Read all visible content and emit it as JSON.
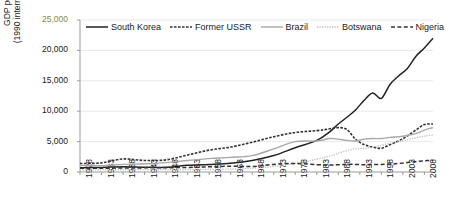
{
  "chart_data": {
    "type": "line",
    "title": "",
    "xlabel": "",
    "ylabel": "GDP per capita\n(1990 international GK$)",
    "ylabel_line1": "GDP per capita",
    "ylabel_line2": "(1990 international GK$)",
    "ylim": [
      0,
      25000
    ],
    "yticks": [
      0,
      5000,
      10000,
      15000,
      20000,
      25000
    ],
    "ytick_labels": [
      "0",
      "5,000",
      "10,000",
      "15,000",
      "20,000",
      "25,000"
    ],
    "xlim": [
      1928,
      2010
    ],
    "xticks": [
      1928,
      1933,
      1938,
      1943,
      1948,
      1953,
      1958,
      1963,
      1968,
      1973,
      1978,
      1983,
      1988,
      1993,
      1998,
      2003,
      2008
    ],
    "xtick_labels": [
      "1928",
      "1933",
      "1938",
      "1943",
      "1948",
      "1953",
      "1958",
      "1963",
      "1968",
      "1973",
      "1978",
      "1983",
      "1988",
      "1993",
      "1998",
      "2003",
      "2008"
    ],
    "grid": "horizontal",
    "legend_position": "top",
    "series": [
      {
        "name": "South Korea",
        "style": "solid",
        "color": "#222222",
        "width": 1.5,
        "x": [
          1928,
          1933,
          1938,
          1943,
          1948,
          1953,
          1958,
          1963,
          1968,
          1973,
          1978,
          1983,
          1986,
          1988,
          1990,
          1992,
          1994,
          1996,
          1998,
          2000,
          2002,
          2004,
          2006,
          2008,
          2010
        ],
        "values": [
          700,
          760,
          880,
          800,
          770,
          1100,
          1250,
          1450,
          1900,
          2700,
          4000,
          5200,
          6600,
          7900,
          9000,
          10200,
          11800,
          13000,
          12100,
          14400,
          15800,
          17000,
          19000,
          20400,
          22000
        ]
      },
      {
        "name": "Former USSR",
        "style": "dotted",
        "color": "#333333",
        "width": 1.6,
        "x": [
          1928,
          1933,
          1938,
          1943,
          1948,
          1953,
          1958,
          1963,
          1968,
          1973,
          1978,
          1983,
          1986,
          1988,
          1990,
          1992,
          1994,
          1996,
          1998,
          2000,
          2002,
          2004,
          2006,
          2008,
          2010
        ],
        "values": [
          1400,
          1500,
          2150,
          1900,
          2000,
          2800,
          3600,
          4100,
          4900,
          5800,
          6500,
          6800,
          7100,
          7300,
          7000,
          5400,
          4500,
          4100,
          3900,
          4500,
          5100,
          5900,
          6900,
          7800,
          7900
        ]
      },
      {
        "name": "Brazil",
        "style": "solid",
        "color": "#a8a8a8",
        "width": 1.4,
        "x": [
          1928,
          1933,
          1938,
          1943,
          1948,
          1953,
          1958,
          1963,
          1968,
          1973,
          1978,
          1983,
          1986,
          1988,
          1990,
          1992,
          1994,
          1996,
          1998,
          2000,
          2002,
          2004,
          2006,
          2008,
          2010
        ],
        "values": [
          1100,
          1050,
          1250,
          1350,
          1550,
          1900,
          2200,
          2400,
          2700,
          3800,
          5000,
          5100,
          5500,
          5400,
          5200,
          5100,
          5400,
          5500,
          5500,
          5700,
          5800,
          6000,
          6300,
          6900,
          7300
        ]
      },
      {
        "name": "Botswana",
        "style": "fine-dotted",
        "color": "#bbbbbb",
        "width": 1.3,
        "x": [
          1928,
          1933,
          1938,
          1943,
          1948,
          1953,
          1958,
          1963,
          1968,
          1973,
          1978,
          1983,
          1986,
          1988,
          1990,
          1992,
          1994,
          1996,
          1998,
          2000,
          2002,
          2004,
          2006,
          2008,
          2010
        ],
        "values": [
          350,
          360,
          380,
          390,
          400,
          420,
          450,
          480,
          600,
          900,
          1400,
          2100,
          2600,
          3100,
          3500,
          3800,
          3900,
          4100,
          4400,
          4700,
          5000,
          5300,
          5600,
          5900,
          6100
        ]
      },
      {
        "name": "Nigeria",
        "style": "dashed",
        "color": "#333333",
        "width": 1.5,
        "x": [
          1928,
          1933,
          1938,
          1943,
          1948,
          1953,
          1958,
          1963,
          1968,
          1973,
          1978,
          1983,
          1986,
          1988,
          1990,
          1992,
          1994,
          1996,
          1998,
          2000,
          2002,
          2004,
          2006,
          2008,
          2010
        ],
        "values": [
          600,
          620,
          650,
          680,
          700,
          750,
          850,
          950,
          900,
          1250,
          1400,
          1200,
          1150,
          1200,
          1250,
          1250,
          1200,
          1250,
          1250,
          1300,
          1400,
          1550,
          1700,
          1850,
          1950
        ]
      }
    ]
  }
}
